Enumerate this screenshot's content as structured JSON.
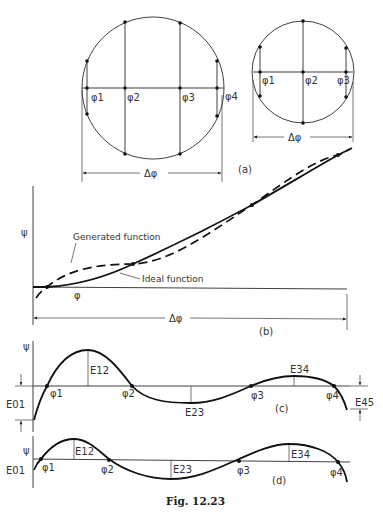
{
  "figure": {
    "caption": "Fig. 12.23",
    "background": "#ffffff",
    "ink_color": "#111111"
  },
  "panel_a": {
    "label": "(a)",
    "large_circle": {
      "precision_points": [
        "φ1",
        "φ2",
        "φ3",
        "φ4"
      ],
      "span_label": "Δφ"
    },
    "small_circle": {
      "precision_points": [
        "φ1",
        "φ2",
        "φ3"
      ],
      "span_label": "Δφ"
    }
  },
  "panel_b": {
    "label": "(b)",
    "y_axis_label": "ψ",
    "x_axis_label": "φ",
    "span_label": "Δφ",
    "generated_label": "Generated function",
    "ideal_label": "Ideal function"
  },
  "panel_c": {
    "label": "(c)",
    "y_axis_label": "ψ",
    "points": [
      "φ1",
      "φ2",
      "φ3",
      "φ4"
    ],
    "errors": [
      "E01",
      "E12",
      "E23",
      "E34",
      "E45"
    ]
  },
  "panel_d": {
    "label": "(d)",
    "y_axis_label": "ψ",
    "points": [
      "φ1",
      "φ2",
      "φ3",
      "φ4"
    ],
    "errors": [
      "E01",
      "E12",
      "E23",
      "E34"
    ]
  }
}
